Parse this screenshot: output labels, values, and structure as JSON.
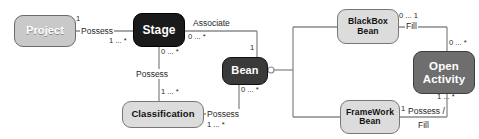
{
  "diagram": {
    "type": "uml-class-association-diagram",
    "background": "#ffffff",
    "colors": {
      "node_light": "#c9c9c9",
      "node_pale": "#dcdcdc",
      "node_dark": "#1a1a1a",
      "node_midgray": "#3a3a3a",
      "node_gray": "#6e6e6e",
      "line": "#8a8a8a",
      "text_dark": "#1f1f1f",
      "text_light": "#ffffff"
    },
    "nodes": [
      {
        "id": "project",
        "label": "Project",
        "style": "light"
      },
      {
        "id": "stage",
        "label": "Stage",
        "style": "dark"
      },
      {
        "id": "classification",
        "label": "Classification",
        "style": "pale"
      },
      {
        "id": "bean",
        "label": "Bean",
        "style": "midgray"
      },
      {
        "id": "blackbox",
        "line1": "BlackBox",
        "line2": "Bean",
        "style": "pale"
      },
      {
        "id": "framework",
        "line1": "FrameWork",
        "line2": "Bean",
        "style": "pale"
      },
      {
        "id": "openactivity",
        "line1": "Open",
        "line2": "Activity",
        "style": "gray"
      }
    ],
    "edge_labels": [
      {
        "id": "possess-project-stage",
        "text": "Possess"
      },
      {
        "id": "associate-stage-bean",
        "text": "Associate"
      },
      {
        "id": "possess-stage-class",
        "text": "Possess"
      },
      {
        "id": "possess-class-bean",
        "text": "Possess"
      },
      {
        "id": "fill-blackbox-open",
        "text": "Fill"
      },
      {
        "id": "possess-fill-fw-open-1",
        "text": "Possess /"
      },
      {
        "id": "possess-fill-fw-open-2",
        "text": "Fill"
      }
    ],
    "multiplicities": [
      {
        "id": "m-project",
        "text": "1"
      },
      {
        "id": "m-stage-from-proj",
        "text": "1 ... *"
      },
      {
        "id": "m-stage-associate",
        "text": "0 ... *"
      },
      {
        "id": "m-bean-associate",
        "text": "1"
      },
      {
        "id": "m-stage-possess",
        "text": "0 ... *"
      },
      {
        "id": "m-class-top",
        "text": "1 ... *"
      },
      {
        "id": "m-class-right",
        "text": "1 ... *"
      },
      {
        "id": "m-bean-possess",
        "text": "0 ... *"
      },
      {
        "id": "m-blackbox-fill",
        "text": "0 ... 1"
      },
      {
        "id": "m-open-fill",
        "text": "0 ... *"
      },
      {
        "id": "m-framework",
        "text": "1"
      },
      {
        "id": "m-open-bottom",
        "text": "1 ... *"
      }
    ]
  }
}
